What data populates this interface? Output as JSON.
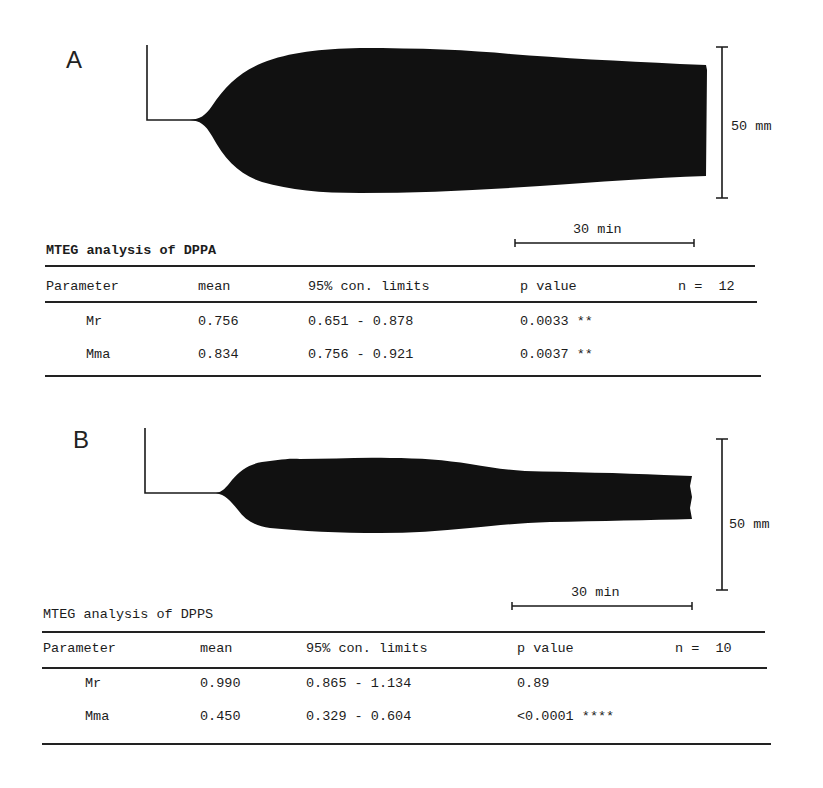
{
  "panels": [
    {
      "letter": "A",
      "vertical_scale_label": "50 mm",
      "horizontal_scale_label": "30 min",
      "table": {
        "title": "MTEG analysis of DPPA",
        "headers": [
          "Parameter",
          "mean",
          "95% con. limits",
          "p value"
        ],
        "n_label": "n =  12",
        "rows": [
          {
            "parameter": "Mr",
            "mean": "0.756",
            "limits": "0.651 - 0.878",
            "p": "0.0033 **"
          },
          {
            "parameter": "Mma",
            "mean": "0.834",
            "limits": "0.756 - 0.921",
            "p": "0.0037 **"
          }
        ]
      }
    },
    {
      "letter": "B",
      "vertical_scale_label": "50 mm",
      "horizontal_scale_label": "30 min",
      "table": {
        "title": "MTEG analysis of DPPS",
        "headers": [
          "Parameter",
          "mean",
          "95% con. limits",
          "p value"
        ],
        "n_label": "n =  10",
        "rows": [
          {
            "parameter": "Mr",
            "mean": "0.990",
            "limits": "0.865 - 1.134",
            "p": "0.89"
          },
          {
            "parameter": "Mma",
            "mean": "0.450",
            "limits": "0.329 - 0.604",
            "p": "<0.0001 ****"
          }
        ]
      }
    }
  ],
  "colors": {
    "ink": "#111111",
    "paper": "#ffffff"
  }
}
